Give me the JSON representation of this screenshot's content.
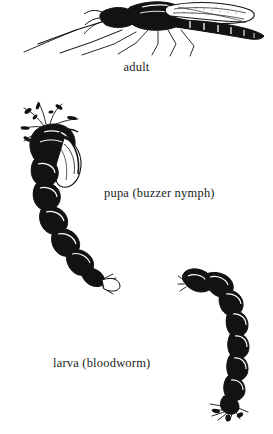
{
  "plate": {
    "title": "Midge life cycle illustration plate",
    "background_color": "#ffffff",
    "ink_color": "#121212",
    "style": "black-and-white engraving / line drawing",
    "width": 273,
    "height": 434
  },
  "figures": [
    {
      "id": "adult",
      "name": "adult-midge-illustration",
      "caption": "adult",
      "description": "Side view of an adult midge with folded wings, long slender legs and segmented abdomen, facing left",
      "position": {
        "x": 18,
        "y": 0,
        "width": 248,
        "height": 56
      }
    },
    {
      "id": "pupa",
      "name": "pupa-illustration",
      "caption": "pupa (buzzer nymph)",
      "description": "Midge pupa with feathery thoracic respiratory filaments at the head and a curved segmented abdomen ending in a fan-shaped tail paddle",
      "position": {
        "x": 14,
        "y": 98,
        "width": 122,
        "height": 190
      }
    },
    {
      "id": "larva",
      "name": "larva-illustration",
      "caption": "larva (bloodworm)",
      "description": "Curved worm-like midge larva with segmented body, head curling to the upper left and bristly prolegs at the tail",
      "position": {
        "x": 178,
        "y": 262,
        "width": 84,
        "height": 158
      }
    }
  ],
  "captions": {
    "adult": "adult",
    "pupa": "pupa (buzzer nymph)",
    "larva": "larva (bloodworm)"
  }
}
